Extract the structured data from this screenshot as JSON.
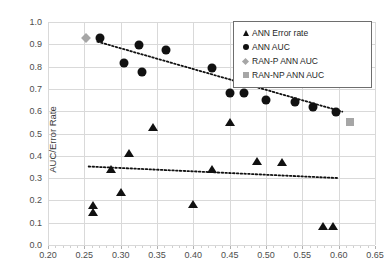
{
  "chart_data": {
    "type": "scatter",
    "title": "",
    "xlabel": "",
    "ylabel": "AUC/Error Rate",
    "xlim": [
      0.2,
      0.65
    ],
    "ylim": [
      0.0,
      1.0
    ],
    "xticks": [
      "0.20",
      "0.25",
      "0.30",
      "0.35",
      "0.40",
      "0.45",
      "0.50",
      "0.55",
      "0.60",
      "0.65"
    ],
    "xtick_values": [
      0.2,
      0.25,
      0.3,
      0.35,
      0.4,
      0.45,
      0.5,
      0.55,
      0.6,
      0.65
    ],
    "yticks": [
      "0.0",
      "0.1",
      "0.2",
      "0.3",
      "0.4",
      "0.5",
      "0.6",
      "0.7",
      "0.8",
      "0.9",
      "1.0"
    ],
    "ytick_values": [
      0.0,
      0.1,
      0.2,
      0.3,
      0.4,
      0.5,
      0.6,
      0.7,
      0.8,
      0.9,
      1.0
    ],
    "grid": true,
    "legend_position": "top-right",
    "series": [
      {
        "name": "ANN Error rate",
        "marker": "triangle",
        "color": "#111111",
        "points": [
          [
            0.262,
            0.182
          ],
          [
            0.262,
            0.152
          ],
          [
            0.287,
            0.345
          ],
          [
            0.3,
            0.24
          ],
          [
            0.312,
            0.418
          ],
          [
            0.345,
            0.535
          ],
          [
            0.4,
            0.19
          ],
          [
            0.425,
            0.345
          ],
          [
            0.45,
            0.555
          ],
          [
            0.487,
            0.382
          ],
          [
            0.522,
            0.378
          ],
          [
            0.578,
            0.09
          ],
          [
            0.592,
            0.09
          ]
        ]
      },
      {
        "name": "ANN AUC",
        "marker": "circle",
        "color": "#111111",
        "points": [
          [
            0.272,
            0.93
          ],
          [
            0.305,
            0.815
          ],
          [
            0.325,
            0.897
          ],
          [
            0.33,
            0.775
          ],
          [
            0.363,
            0.873
          ],
          [
            0.425,
            0.793
          ],
          [
            0.45,
            0.683
          ],
          [
            0.47,
            0.683
          ],
          [
            0.5,
            0.652
          ],
          [
            0.54,
            0.64
          ],
          [
            0.565,
            0.617
          ],
          [
            0.597,
            0.597
          ]
        ]
      },
      {
        "name": "RAN-P ANN AUC",
        "marker": "diamond",
        "color": "#a6a6a6",
        "points": [
          [
            0.252,
            0.928
          ]
        ]
      },
      {
        "name": "RAN-NP ANN AUC",
        "marker": "square",
        "color": "#a6a6a6",
        "points": [
          [
            0.615,
            0.55
          ]
        ]
      }
    ],
    "trendlines": [
      {
        "name": "ANN AUC trend",
        "style": "dotted",
        "color": "#111111",
        "x_start": 0.268,
        "y_start": 0.912,
        "x_end": 0.605,
        "y_end": 0.598
      },
      {
        "name": "ANN Error rate trend",
        "style": "dotted",
        "color": "#111111",
        "x_start": 0.256,
        "y_start": 0.352,
        "x_end": 0.6,
        "y_end": 0.3
      }
    ]
  },
  "legend": {
    "items": [
      {
        "label": "ANN Error rate",
        "marker": "triangle"
      },
      {
        "label": "ANN AUC",
        "marker": "circle"
      },
      {
        "label": "RAN-P ANN AUC",
        "marker": "diamond"
      },
      {
        "label": "RAN-NP ANN AUC",
        "marker": "square"
      }
    ]
  }
}
